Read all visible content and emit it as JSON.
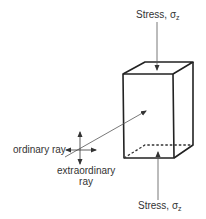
{
  "diagram": {
    "top_stress": {
      "label": "Stress, ",
      "symbol": "σ",
      "subscript": "z"
    },
    "bottom_stress": {
      "label": "Stress, ",
      "symbol": "σ",
      "subscript": "z"
    },
    "ordinary_ray": "ordinary ray",
    "extraordinary_ray_line1": "extraordinary",
    "extraordinary_ray_line2": "ray",
    "colors": {
      "line": "#222222",
      "text": "#333333",
      "thin": "#555555"
    }
  }
}
